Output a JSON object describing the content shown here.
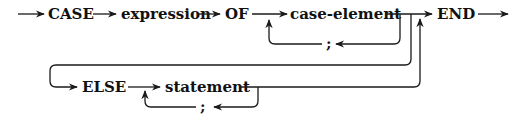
{
  "diagram": {
    "type": "syntax-diagram",
    "nodes": {
      "case_kw": "CASE",
      "expression": "expression",
      "of_kw": "OF",
      "case_element": "case-element",
      "case_sep": ";",
      "end_kw": "END",
      "else_kw": "ELSE",
      "statement": "statement",
      "stmt_sep": ";"
    },
    "edges": [
      {
        "from": "start",
        "to": "CASE"
      },
      {
        "from": "CASE",
        "to": "expression"
      },
      {
        "from": "expression",
        "to": "OF"
      },
      {
        "from": "OF",
        "to": "case-element"
      },
      {
        "from": "case-element",
        "to": ";",
        "note": "loop back to case-element"
      },
      {
        "from": ";",
        "to": "case-element"
      },
      {
        "from": "case-element",
        "to": "END"
      },
      {
        "from": "case-element",
        "to": "ELSE"
      },
      {
        "from": "ELSE",
        "to": "statement"
      },
      {
        "from": "statement",
        "to": ";",
        "note": "loop back to statement"
      },
      {
        "from": ";",
        "to": "statement"
      },
      {
        "from": "statement",
        "to": "END"
      },
      {
        "from": "END",
        "to": "end"
      }
    ]
  }
}
